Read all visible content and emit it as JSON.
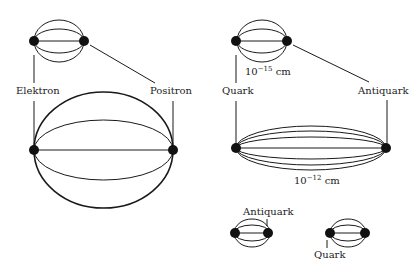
{
  "left_panel": {
    "particle_a": "Elektron",
    "particle_b": "Positron"
  },
  "right_panel": {
    "particle_a": "Quark",
    "particle_b": "Antiquark",
    "small_size_base": "10",
    "small_size_exp": "−15",
    "small_size_unit": " cm",
    "large_size_base": "10",
    "large_size_exp": "−12",
    "large_size_unit": " cm",
    "split_label_antiquark": "Antiquark",
    "split_label_quark": "Quark"
  },
  "colors": {
    "ink": "#1a1a1a",
    "background": "#ffffff"
  }
}
